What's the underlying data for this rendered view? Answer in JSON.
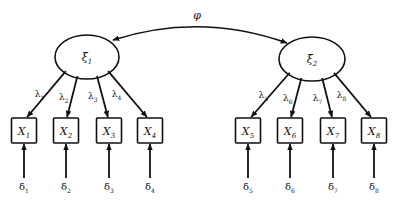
{
  "diagram": {
    "type": "confirmatory-factor-analysis",
    "colors": {
      "stroke": "#111111",
      "background": "#ffffff"
    },
    "covariance": {
      "label": "φ",
      "from": "xi1",
      "to": "xi2"
    },
    "latents": [
      {
        "id": "xi1",
        "symbol": "ξ",
        "sub": "1",
        "cx": 87,
        "cy": 57,
        "rx": 32,
        "ry": 22
      },
      {
        "id": "xi2",
        "symbol": "ξ",
        "sub": "2",
        "cx": 312,
        "cy": 59,
        "rx": 33,
        "ry": 22
      }
    ],
    "indicators": [
      {
        "id": "X1",
        "symbol": "X",
        "sub": "1",
        "factor": "xi1",
        "cx": 24,
        "loading": {
          "symbol": "λ",
          "sub": "1"
        },
        "error": {
          "symbol": "δ",
          "sub": "1"
        }
      },
      {
        "id": "X2",
        "symbol": "X",
        "sub": "2",
        "factor": "xi1",
        "cx": 66,
        "loading": {
          "symbol": "λ",
          "sub": "2"
        },
        "error": {
          "symbol": "δ",
          "sub": "2"
        }
      },
      {
        "id": "X3",
        "symbol": "X",
        "sub": "3",
        "factor": "xi1",
        "cx": 109,
        "loading": {
          "symbol": "λ",
          "sub": "3"
        },
        "error": {
          "symbol": "δ",
          "sub": "3"
        }
      },
      {
        "id": "X4",
        "symbol": "X",
        "sub": "4",
        "factor": "xi1",
        "cx": 150,
        "loading": {
          "symbol": "λ",
          "sub": "4"
        },
        "error": {
          "symbol": "δ",
          "sub": "4"
        }
      },
      {
        "id": "X5",
        "symbol": "X",
        "sub": "5",
        "factor": "xi2",
        "cx": 248,
        "loading": {
          "symbol": "λ",
          "sub": "5"
        },
        "error": {
          "symbol": "δ",
          "sub": "5"
        }
      },
      {
        "id": "X6",
        "symbol": "X",
        "sub": "6",
        "factor": "xi2",
        "cx": 290,
        "loading": {
          "symbol": "λ",
          "sub": "6"
        },
        "error": {
          "symbol": "δ",
          "sub": "6"
        }
      },
      {
        "id": "X7",
        "symbol": "X",
        "sub": "7",
        "factor": "xi2",
        "cx": 333,
        "loading": {
          "symbol": "λ",
          "sub": "7"
        },
        "error": {
          "symbol": "δ",
          "sub": "7"
        }
      },
      {
        "id": "X8",
        "symbol": "X",
        "sub": "8",
        "factor": "xi2",
        "cx": 374,
        "loading": {
          "symbol": "λ",
          "sub": "8"
        },
        "error": {
          "symbol": "δ",
          "sub": "8"
        }
      }
    ]
  }
}
